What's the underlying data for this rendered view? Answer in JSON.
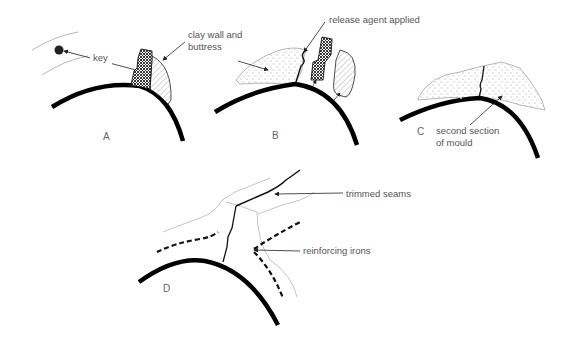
{
  "panels": {
    "A": {
      "label": "A",
      "annotations": {
        "key": "key",
        "clay_line1": "clay wall and",
        "clay_line2": "buttress"
      }
    },
    "B": {
      "label": "B",
      "annotations": {
        "release": "release agent applied"
      }
    },
    "C": {
      "label": "C",
      "annotations": {
        "second_line1": "second section",
        "second_line2": "of mould"
      }
    },
    "D": {
      "label": "D",
      "annotations": {
        "seams": "trimmed seams",
        "irons": "reinforcing irons"
      }
    }
  }
}
